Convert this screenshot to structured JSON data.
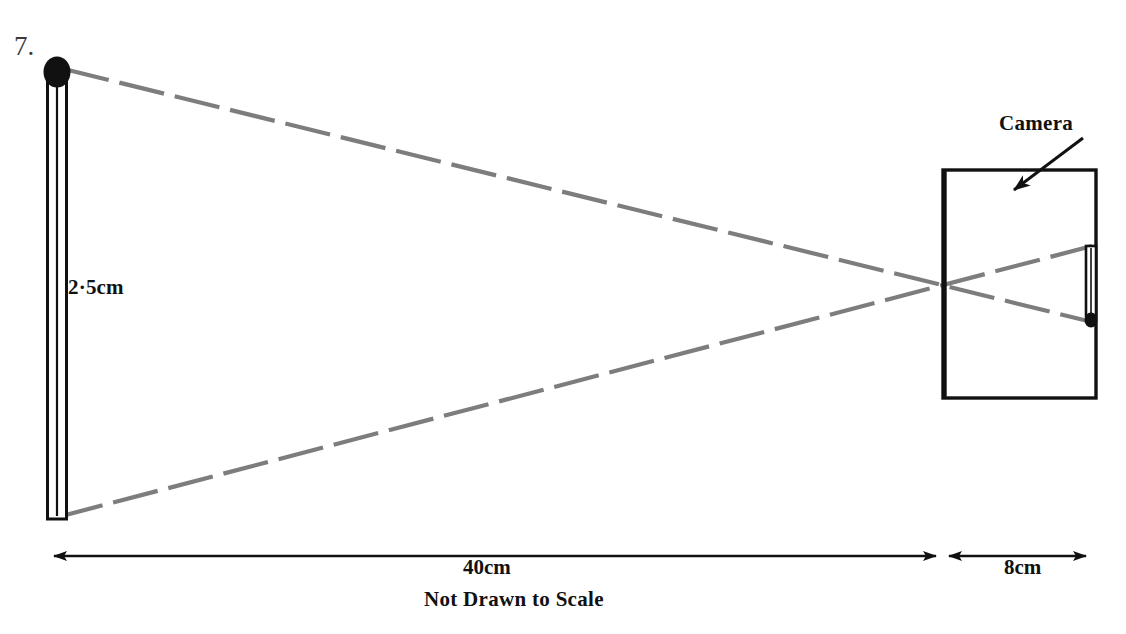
{
  "diagram": {
    "question_number": "7.",
    "title_note": "Not Drawn to Scale",
    "labels": {
      "object_height": "2·5cm",
      "camera": "Camera",
      "object_distance": "40cm",
      "camera_depth": "8cm"
    },
    "colors": {
      "ink": "#111111",
      "ray": "#7d7d7d",
      "background": "#ffffff",
      "number_ink": "#3a3a3a"
    },
    "elements": {
      "object_name": "matchstick-object",
      "image_name": "matchstick-inverted-image",
      "camera_box_name": "camera-body",
      "ray_upper_name": "ray-from-match-head",
      "ray_lower_name": "ray-from-match-base",
      "pinhole_name": "pinhole-aperture"
    },
    "geometry": {
      "object_head_center": [
        57,
        72
      ],
      "object_base": [
        57,
        518
      ],
      "pinhole": [
        945,
        287
      ],
      "camera_rect": [
        943,
        170,
        153,
        228
      ],
      "image_top": [
        1091,
        245
      ],
      "image_head": [
        1091,
        321
      ]
    }
  }
}
